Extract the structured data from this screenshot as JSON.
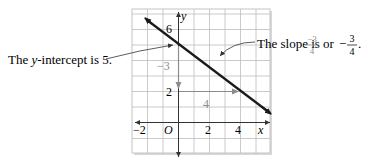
{
  "figure": {
    "axis_labels": {
      "x": "x",
      "y": "y"
    },
    "x_ticks": [
      {
        "value": -2,
        "label": "−2"
      },
      {
        "value": 0,
        "label": "O"
      },
      {
        "value": 2,
        "label": "2"
      },
      {
        "value": 4,
        "label": "4"
      }
    ],
    "y_ticks": [
      {
        "value": 6,
        "label": "6"
      },
      {
        "value": 2,
        "label": "2"
      }
    ],
    "line": {
      "slope": -0.75,
      "intercept": 5,
      "color": "#1a1a1a"
    },
    "rise_run": {
      "rise_label": "−3",
      "run_label": "4",
      "color": "#8c8c8c"
    },
    "annotations": {
      "intercept_text": "The y-intercept is 5.",
      "intercept_prefix": "The ",
      "intercept_var": "y",
      "intercept_suffix": "-intercept is 5.",
      "slope_prefix": "The slope is ",
      "slope_frac1_num": "−3",
      "slope_frac1_den": "4",
      "slope_or": "or",
      "slope_neg": "−",
      "slope_frac2_num": "3",
      "slope_frac2_den": "4",
      "slope_end": "."
    },
    "colors": {
      "grid": "#b8b8b8",
      "axis": "#333333",
      "frame_shadow": "#cfcfcf",
      "gray_text": "#8c8c8c"
    }
  }
}
